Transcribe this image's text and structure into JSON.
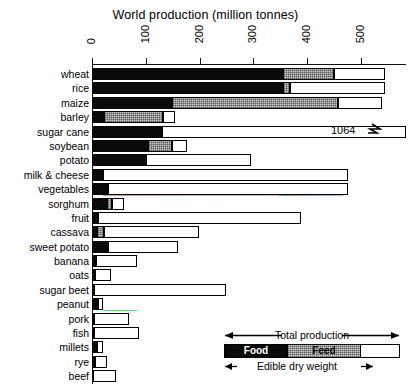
{
  "chart_data": {
    "type": "bar",
    "orientation": "horizontal",
    "stacked": true,
    "title": "World production (million tonnes)",
    "xlabel": "",
    "ylabel": "",
    "xlim": [
      0,
      585
    ],
    "xticks": [
      0,
      100,
      200,
      300,
      400,
      500
    ],
    "xticklabels": [
      "0",
      "100",
      "200",
      "300",
      "400",
      "500"
    ],
    "grid": false,
    "legend_position": "bottom-right",
    "categories": [
      "wheat",
      "rice",
      "maize",
      "barley",
      "sugar cane",
      "soybean",
      "potato",
      "milk & cheese",
      "vegetables",
      "sorghum",
      "fruit",
      "cassava",
      "sweet potato",
      "banana",
      "oats",
      "sugar beet",
      "peanut",
      "pork",
      "fish",
      "millets",
      "rye",
      "beef"
    ],
    "series": [
      {
        "name": "Food",
        "values": [
          355,
          356,
          148,
          22,
          130,
          104,
          100,
          20,
          30,
          28,
          12,
          9,
          30,
          8,
          5,
          4,
          7,
          3,
          3,
          10,
          5,
          2
        ]
      },
      {
        "name": "Feed",
        "values": [
          95,
          12,
          310,
          110,
          0,
          44,
          0,
          0,
          0,
          10,
          0,
          14,
          0,
          0,
          0,
          0,
          4,
          0,
          0,
          0,
          0,
          0
        ]
      },
      {
        "name": "Other (total production)",
        "values": [
          95,
          177,
          82,
          22,
          934,
          28,
          195,
          457,
          447,
          22,
          377,
          177,
          130,
          75,
          30,
          245,
          10,
          65,
          85,
          10,
          22,
          42
        ]
      }
    ],
    "totals": [
      545,
      545,
      540,
      154,
      1064,
      176,
      295,
      477,
      477,
      60,
      389,
      200,
      160,
      83,
      35,
      249,
      21,
      68,
      88,
      20,
      27,
      44
    ],
    "annotations": [
      {
        "text": "1064",
        "category": "sugar cane",
        "note": "value exceeds axis; bar broken at right edge"
      }
    ],
    "legend_entries": [
      "Food",
      "Feed"
    ],
    "legend_span_top": "Total production",
    "legend_span_bottom": "Edible dry weight",
    "colors": {
      "food": "#0a0a0a",
      "feed": "#c9c9c9",
      "other": "#ffffff",
      "axis": "#111111"
    }
  },
  "chart": {
    "title": "World production (million tonnes)",
    "axis": {
      "ticks": [
        {
          "label": "0",
          "value": 0
        },
        {
          "label": "100",
          "value": 100
        },
        {
          "label": "200",
          "value": 200
        },
        {
          "label": "300",
          "value": 300
        },
        {
          "label": "400",
          "value": 400
        },
        {
          "label": "500",
          "value": 500
        }
      ]
    },
    "rows": [
      {
        "label": "wheat",
        "food": 355,
        "feed": 95,
        "other": 95
      },
      {
        "label": "rice",
        "food": 356,
        "feed": 12,
        "other": 177
      },
      {
        "label": "maize",
        "food": 148,
        "feed": 310,
        "other": 82
      },
      {
        "label": "barley",
        "food": 22,
        "feed": 110,
        "other": 22
      },
      {
        "label": "sugar cane",
        "food": 130,
        "feed": 0,
        "other": 934
      },
      {
        "label": "soybean",
        "food": 104,
        "feed": 44,
        "other": 28
      },
      {
        "label": "potato",
        "food": 100,
        "feed": 0,
        "other": 195
      },
      {
        "label": "milk & cheese",
        "food": 20,
        "feed": 0,
        "other": 457
      },
      {
        "label": "vegetables",
        "food": 30,
        "feed": 0,
        "other": 447
      },
      {
        "label": "sorghum",
        "food": 28,
        "feed": 10,
        "other": 22
      },
      {
        "label": "fruit",
        "food": 12,
        "feed": 0,
        "other": 377
      },
      {
        "label": "cassava",
        "food": 9,
        "feed": 14,
        "other": 177
      },
      {
        "label": "sweet potato",
        "food": 30,
        "feed": 0,
        "other": 130
      },
      {
        "label": "banana",
        "food": 8,
        "feed": 0,
        "other": 75
      },
      {
        "label": "oats",
        "food": 5,
        "feed": 0,
        "other": 30
      },
      {
        "label": "sugar beet",
        "food": 4,
        "feed": 0,
        "other": 245
      },
      {
        "label": "peanut",
        "food": 7,
        "feed": 4,
        "other": 10
      },
      {
        "label": "pork",
        "food": 3,
        "feed": 0,
        "other": 65
      },
      {
        "label": "fish",
        "food": 3,
        "feed": 0,
        "other": 85
      },
      {
        "label": "millets",
        "food": 10,
        "feed": 0,
        "other": 10
      },
      {
        "label": "rye",
        "food": 5,
        "feed": 0,
        "other": 22
      },
      {
        "label": "beef",
        "food": 2,
        "feed": 0,
        "other": 42
      }
    ],
    "break_value": "1064"
  },
  "legend": {
    "total_production": "Total production",
    "food": "Food",
    "feed": "Feed",
    "edible": "Edible dry weight"
  }
}
